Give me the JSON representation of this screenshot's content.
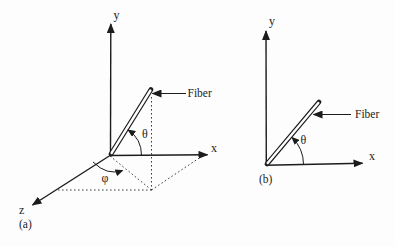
{
  "figure": {
    "colors": {
      "background": "#fdfdfd",
      "ink": "#1c1c1c"
    },
    "panels": [
      {
        "caption": "(a)",
        "y_label": "y",
        "x_label": "x",
        "z_label": "z",
        "fiber_label": "Fiber",
        "theta_label": "θ",
        "phi_label": "φ"
      },
      {
        "caption": "(b)",
        "y_label": "y",
        "x_label": "x",
        "fiber_label": "Fiber",
        "theta_label": "θ"
      }
    ]
  }
}
